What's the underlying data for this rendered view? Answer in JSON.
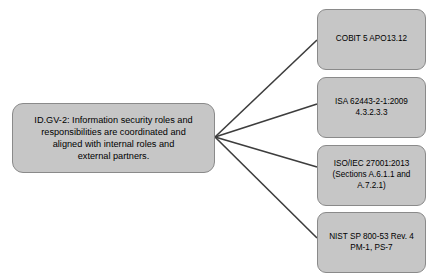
{
  "diagram": {
    "type": "node-link",
    "title": "",
    "colors": {
      "node_fill": "#c6c6c6",
      "node_border": "#8a8a8a",
      "connector": "#3d3d3d",
      "background": "#ffffff",
      "text": "#000000"
    },
    "main_node": {
      "id": "ID.GV-2",
      "text": "ID.GV-2: Information security roles and\nresponsibilities are coordinated and\naligned with internal roles and\nexternal partners.",
      "lines": [
        "ID.GV-2: Information security roles and",
        "responsibilities are coordinated and",
        "aligned with internal roles and",
        "external partners."
      ]
    },
    "reference_nodes": [
      {
        "id": "cobit",
        "text": "COBIT 5 APO13.12",
        "lines": [
          "COBIT 5 APO13.12"
        ]
      },
      {
        "id": "isa",
        "text": "ISA 62443-2-1:2009\n4.3.2.3.3",
        "lines": [
          "ISA 62443-2-1:2009",
          "4.3.2.3.3"
        ]
      },
      {
        "id": "iso-iec",
        "text": "ISO/IEC 27001:2013\n(Sections A.6.1.1 and\nA.7.2.1)",
        "lines": [
          "ISO/IEC 27001:2013",
          "(Sections A.6.1.1 and",
          "A.7.2.1)"
        ]
      },
      {
        "id": "nist-sp",
        "text": "NIST SP 800-53 Rev. 4\nPM-1, PS-7",
        "lines": [
          "NIST SP 800-53 Rev. 4",
          "PM-1, PS-7"
        ]
      }
    ],
    "connectors": [
      {
        "from": "ID.GV-2",
        "to": "cobit",
        "x1": 215,
        "y1": 137,
        "x2": 317,
        "y2": 40
      },
      {
        "from": "ID.GV-2",
        "to": "isa",
        "x1": 215,
        "y1": 137,
        "x2": 317,
        "y2": 104
      },
      {
        "from": "ID.GV-2",
        "to": "iso-iec",
        "x1": 215,
        "y1": 137,
        "x2": 317,
        "y2": 167
      },
      {
        "from": "ID.GV-2",
        "to": "nist-sp",
        "x1": 215,
        "y1": 137,
        "x2": 317,
        "y2": 238
      }
    ]
  }
}
